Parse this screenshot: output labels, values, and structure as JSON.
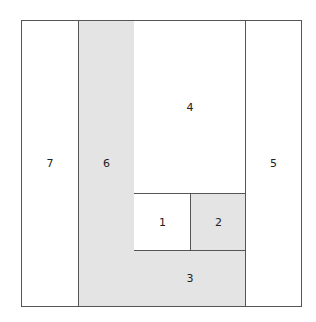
{
  "diagram": {
    "type": "rectangle-partition",
    "regions": [
      {
        "id": "7",
        "label": "7",
        "fill": "#ffffff"
      },
      {
        "id": "6",
        "label": "6",
        "fill": "#e4e4e4"
      },
      {
        "id": "4",
        "label": "4",
        "fill": "#ffffff"
      },
      {
        "id": "1",
        "label": "1",
        "fill": "#ffffff"
      },
      {
        "id": "2",
        "label": "2",
        "fill": "#e4e4e4"
      },
      {
        "id": "3",
        "label": "3",
        "fill": "#e4e4e4"
      },
      {
        "id": "5",
        "label": "5",
        "fill": "#ffffff"
      }
    ],
    "colors": {
      "border": "#555555",
      "shaded": "#e4e4e4",
      "white": "#ffffff"
    }
  }
}
